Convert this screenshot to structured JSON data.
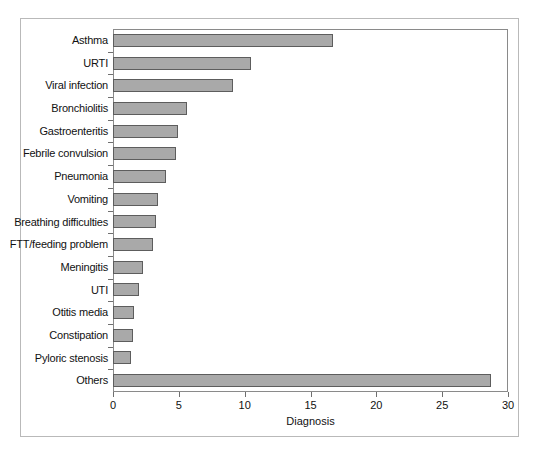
{
  "chart_data": {
    "type": "bar",
    "orientation": "horizontal",
    "title": "",
    "xlabel": "Diagnosis",
    "ylabel": "",
    "xlim": [
      0,
      30
    ],
    "xticks": [
      0,
      5,
      10,
      15,
      20,
      25,
      30
    ],
    "grid": false,
    "legend": null,
    "bar_color": "#a9a9a9",
    "bar_edge_color": "#5d5d5d",
    "categories": [
      "Asthma",
      "URTI",
      "Viral infection",
      "Bronchiolitis",
      "Gastroenteritis",
      "Febrile convulsion",
      "Pneumonia",
      "Vomiting",
      "Breathing difficulties",
      "FTT/feeding problem",
      "Meningitis",
      "UTI",
      "Otitis media",
      "Constipation",
      "Pyloric stenosis",
      "Others"
    ],
    "values": [
      16.7,
      10.5,
      9.1,
      5.6,
      4.9,
      4.8,
      4.0,
      3.4,
      3.3,
      3.0,
      2.3,
      2.0,
      1.6,
      1.5,
      1.4,
      28.7
    ]
  }
}
